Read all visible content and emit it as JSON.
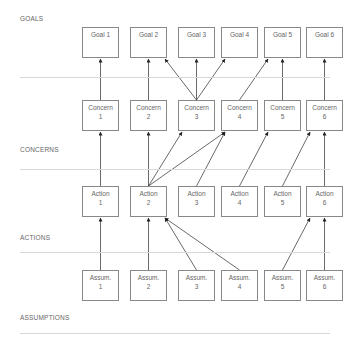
{
  "rows": [
    {
      "label": "GOALS",
      "label_y": 15,
      "sep_y": 77,
      "box_y": 27,
      "nodes": [
        {
          "id": "G1",
          "line1": "Goal 1",
          "line2": ""
        },
        {
          "id": "G2",
          "line1": "Goal 2",
          "line2": ""
        },
        {
          "id": "G3",
          "line1": "Goal 3",
          "line2": ""
        },
        {
          "id": "G4",
          "line1": "Goal 4",
          "line2": ""
        },
        {
          "id": "G5",
          "line1": "Goal 5",
          "line2": ""
        },
        {
          "id": "G6",
          "line1": "Goal 6",
          "line2": ""
        }
      ]
    },
    {
      "label": "CONCERNS",
      "label_y": 146,
      "sep_y": 169,
      "box_y": 100,
      "nodes": [
        {
          "id": "C1",
          "line1": "Concern",
          "line2": "1"
        },
        {
          "id": "C2",
          "line1": "Concern",
          "line2": "2"
        },
        {
          "id": "C3",
          "line1": "Concern",
          "line2": "3"
        },
        {
          "id": "C4",
          "line1": "Concern",
          "line2": "4"
        },
        {
          "id": "C5",
          "line1": "Concern",
          "line2": "5"
        },
        {
          "id": "C6",
          "line1": "Concern",
          "line2": "6"
        }
      ]
    },
    {
      "label": "ACTIONS",
      "label_y": 234,
      "sep_y": 252,
      "box_y": 186,
      "nodes": [
        {
          "id": "A1",
          "line1": "Action",
          "line2": "1"
        },
        {
          "id": "A2",
          "line1": "Action",
          "line2": "2"
        },
        {
          "id": "A3",
          "line1": "Action",
          "line2": "3"
        },
        {
          "id": "A4",
          "line1": "Action",
          "line2": "4"
        },
        {
          "id": "A5",
          "line1": "Action",
          "line2": "5"
        },
        {
          "id": "A6",
          "line1": "Action",
          "line2": "6"
        }
      ]
    },
    {
      "label": "ASSUMPTIONS",
      "label_y": 314,
      "sep_y": 333,
      "box_y": 270,
      "nodes": [
        {
          "id": "S1",
          "line1": "Assum.",
          "line2": "1"
        },
        {
          "id": "S2",
          "line1": "Assum.",
          "line2": "2"
        },
        {
          "id": "S3",
          "line1": "Assum.",
          "line2": "3"
        },
        {
          "id": "S4",
          "line1": "Assum.",
          "line2": "4"
        },
        {
          "id": "S5",
          "line1": "Assum.",
          "line2": "5"
        },
        {
          "id": "S6",
          "line1": "Assum.",
          "line2": "6"
        }
      ]
    }
  ],
  "columns_x": [
    82,
    130,
    178,
    221,
    264,
    306
  ],
  "edges": [
    {
      "from": "C1",
      "to": "G1"
    },
    {
      "from": "C2",
      "to": "G2"
    },
    {
      "from": "C3",
      "to": "G2"
    },
    {
      "from": "C3",
      "to": "G3"
    },
    {
      "from": "C3",
      "to": "G4"
    },
    {
      "from": "C4",
      "to": "G5"
    },
    {
      "from": "C5",
      "to": "G5"
    },
    {
      "from": "C6",
      "to": "G6"
    },
    {
      "from": "A1",
      "to": "C1"
    },
    {
      "from": "A2",
      "to": "C2"
    },
    {
      "from": "A2",
      "to": "C3"
    },
    {
      "from": "A2",
      "to": "C4"
    },
    {
      "from": "A3",
      "to": "C4"
    },
    {
      "from": "A4",
      "to": "C5"
    },
    {
      "from": "A5",
      "to": "C6"
    },
    {
      "from": "A6",
      "to": "C6"
    },
    {
      "from": "S1",
      "to": "A1"
    },
    {
      "from": "S2",
      "to": "A2"
    },
    {
      "from": "S3",
      "to": "A2"
    },
    {
      "from": "S4",
      "to": "A2"
    },
    {
      "from": "S5",
      "to": "A6"
    },
    {
      "from": "S6",
      "to": "A6"
    }
  ],
  "colors": {
    "box_border": "#888888",
    "text": "#666666",
    "separator": "#d8d8d8",
    "arrow": "#333333"
  }
}
